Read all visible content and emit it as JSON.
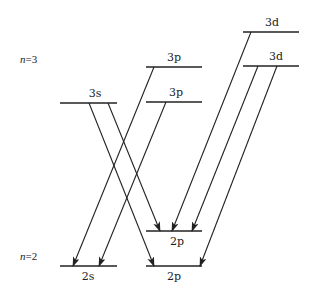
{
  "diagram": {
    "title": "",
    "shells": [
      {
        "id": "n3",
        "prefix": "n",
        "label": "=3",
        "x": 20,
        "y": 63
      },
      {
        "id": "n2",
        "prefix": "n",
        "label": "=2",
        "x": 20,
        "y": 260
      }
    ],
    "levels": [
      {
        "id": "3d_top",
        "label": "3d",
        "x1": 243,
        "x2": 299,
        "y": 32,
        "label_x": 272,
        "label_y": 26
      },
      {
        "id": "3p_top",
        "label": "3p",
        "x1": 146,
        "x2": 202,
        "y": 67,
        "label_x": 174,
        "label_y": 61
      },
      {
        "id": "3d_bot",
        "label": "3d",
        "x1": 243,
        "x2": 299,
        "y": 66,
        "label_x": 276,
        "label_y": 60
      },
      {
        "id": "3s",
        "label": "3s",
        "x1": 60,
        "x2": 117,
        "y": 103,
        "label_x": 95,
        "label_y": 97
      },
      {
        "id": "3p_bot",
        "label": "3p",
        "x1": 146,
        "x2": 202,
        "y": 102,
        "label_x": 176,
        "label_y": 96
      },
      {
        "id": "2p_top",
        "label": "2p",
        "x1": 146,
        "x2": 202,
        "y": 231,
        "label_x": 177,
        "label_y": 245
      },
      {
        "id": "2s",
        "label": "2s",
        "x1": 60,
        "x2": 117,
        "y": 266,
        "label_x": 88,
        "label_y": 280
      },
      {
        "id": "2p_bot",
        "label": "2p",
        "x1": 146,
        "x2": 202,
        "y": 266,
        "label_x": 174,
        "label_y": 280
      }
    ],
    "transitions": [
      {
        "from": "3s",
        "to": "2p_bot",
        "x1": 89,
        "y1": 103,
        "x2": 154,
        "y2": 266
      },
      {
        "from": "3s",
        "to": "2p_top",
        "x1": 108,
        "y1": 103,
        "x2": 160,
        "y2": 231
      },
      {
        "from": "3p_top",
        "to": "2s",
        "x1": 154,
        "y1": 67,
        "x2": 73,
        "y2": 266
      },
      {
        "from": "3p_bot",
        "to": "2s",
        "x1": 166,
        "y1": 102,
        "x2": 99,
        "y2": 266
      },
      {
        "from": "3d_top",
        "to": "2p_top",
        "x1": 251,
        "y1": 32,
        "x2": 172,
        "y2": 231
      },
      {
        "from": "3d_bot",
        "to": "2p_top",
        "x1": 258,
        "y1": 66,
        "x2": 192,
        "y2": 231
      },
      {
        "from": "3d_bot",
        "to": "2p_bot",
        "x1": 277,
        "y1": 66,
        "x2": 200,
        "y2": 266
      }
    ]
  }
}
